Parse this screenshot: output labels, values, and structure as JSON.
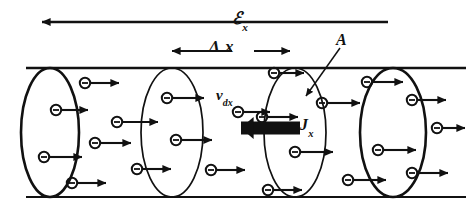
{
  "figure": {
    "background_color": "#ffffff",
    "ink_color": "#111111",
    "width": 466,
    "height": 212
  },
  "labels": {
    "field": {
      "symbol": "ℰ",
      "subscript": "x",
      "name": "electric-field-x"
    },
    "length": {
      "symbol": "Δ x",
      "name": "delta-x-length"
    },
    "area": {
      "symbol": "A",
      "name": "cross-sectional-area"
    },
    "drift_velocity": {
      "symbol": "v",
      "subscript": "dx",
      "name": "drift-velocity-x"
    },
    "current_density": {
      "symbol": "J",
      "subscript": "x",
      "name": "current-density-x"
    }
  },
  "annotations": {
    "field_arrow": {
      "direction": "left",
      "x1": 388,
      "x2": 34,
      "y": 22,
      "name": "field-arrow"
    },
    "delta_x_arrow": {
      "direction": "both",
      "x1": 166,
      "x2": 296,
      "y": 51,
      "name": "delta-x-arrow"
    },
    "area_leader": {
      "x1": 338,
      "y1": 47,
      "x2": 306,
      "y2": 95,
      "name": "area-leader-line"
    },
    "current_arrow": {
      "direction": "left",
      "x1": 300,
      "x2": 226,
      "y": 128,
      "thickness": 13,
      "name": "current-density-arrow"
    }
  },
  "cylinder": {
    "top_y": 68,
    "bottom_y": 197,
    "left_x": 22,
    "right_x": 466,
    "caps": [
      {
        "cx": 50,
        "rx": 29,
        "name": "left-end-cap",
        "stroke": 2.6,
        "full": true
      },
      {
        "cx": 393,
        "rx": 33,
        "name": "right-end-cap",
        "stroke": 2.6,
        "full": true
      }
    ],
    "internal_disks": [
      {
        "cx": 172,
        "rx": 31,
        "name": "internal-disk-1",
        "stroke": 1.7
      },
      {
        "cx": 295,
        "rx": 31,
        "name": "internal-disk-2",
        "stroke": 1.7
      }
    ]
  },
  "electrons": [
    {
      "cx": 85,
      "cy": 83,
      "len": 28,
      "name": "electron-1"
    },
    {
      "cx": 56,
      "cy": 110,
      "len": 26,
      "name": "electron-2"
    },
    {
      "cx": 167,
      "cy": 98,
      "len": 31,
      "name": "electron-3"
    },
    {
      "cx": 117,
      "cy": 122,
      "len": 35,
      "name": "electron-4"
    },
    {
      "cx": 44,
      "cy": 157,
      "len": 32,
      "name": "electron-5"
    },
    {
      "cx": 95,
      "cy": 143,
      "len": 30,
      "name": "electron-6"
    },
    {
      "cx": 176,
      "cy": 140,
      "len": 30,
      "name": "electron-7"
    },
    {
      "cx": 137,
      "cy": 169,
      "len": 28,
      "name": "electron-8"
    },
    {
      "cx": 72,
      "cy": 183,
      "len": 28,
      "name": "electron-9"
    },
    {
      "cx": 211,
      "cy": 170,
      "len": 28,
      "name": "electron-10"
    },
    {
      "cx": 238,
      "cy": 112,
      "len": 26,
      "name": "electron-11"
    },
    {
      "cx": 274,
      "cy": 73,
      "len": 24,
      "name": "electron-12"
    },
    {
      "cx": 262,
      "cy": 117,
      "len": 30,
      "name": "electron-13"
    },
    {
      "cx": 322,
      "cy": 103,
      "len": 32,
      "name": "electron-14"
    },
    {
      "cx": 295,
      "cy": 152,
      "len": 32,
      "name": "electron-15"
    },
    {
      "cx": 348,
      "cy": 180,
      "len": 32,
      "name": "electron-16"
    },
    {
      "cx": 268,
      "cy": 190,
      "len": 28,
      "name": "electron-17"
    },
    {
      "cx": 367,
      "cy": 82,
      "len": 30,
      "name": "electron-18"
    },
    {
      "cx": 378,
      "cy": 150,
      "len": 32,
      "name": "electron-19"
    },
    {
      "cx": 412,
      "cy": 100,
      "len": 28,
      "name": "electron-20"
    },
    {
      "cx": 412,
      "cy": 173,
      "len": 30,
      "name": "electron-21"
    },
    {
      "cx": 437,
      "cy": 128,
      "len": 22,
      "name": "electron-22"
    }
  ]
}
